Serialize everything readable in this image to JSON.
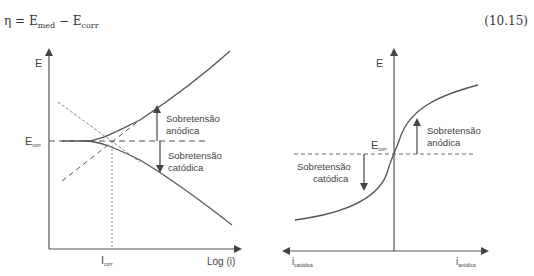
{
  "equation": {
    "eta": "η",
    "equals": " = E",
    "sub1": "med",
    "minus": " − E",
    "sub2": "corr",
    "number": "(10.15)"
  },
  "left_diagram": {
    "y_axis_label": "E",
    "x_axis_label": "Log (i)",
    "ecorr_main": "E",
    "ecorr_sub": "corr",
    "icorr_main": "I",
    "icorr_sub": "corr",
    "anodic_label_1": "Sobretensão",
    "anodic_label_2": "anódica",
    "cathodic_label_1": "Sobretensão",
    "cathodic_label_2": "catódica"
  },
  "right_diagram": {
    "y_axis_label": "E",
    "ecorr_main": "E",
    "ecorr_sub": "corr",
    "anodic_label_1": "Sobretensão",
    "anodic_label_2": "anódica",
    "cathodic_label_1": "Sobretensão",
    "cathodic_label_2": "catódica",
    "x_left_main": "i",
    "x_left_sub": "catódica",
    "x_right_main": "i",
    "x_right_sub": "anódica"
  },
  "colors": {
    "line": "#555555",
    "text": "#444444"
  }
}
